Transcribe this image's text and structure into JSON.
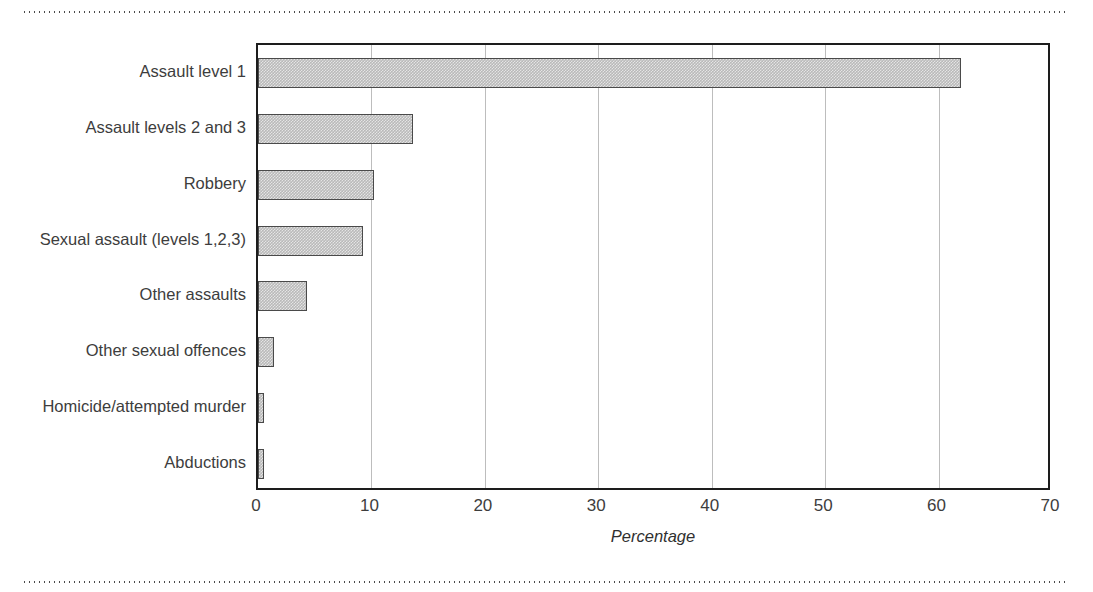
{
  "chart_data": {
    "type": "bar",
    "orientation": "horizontal",
    "title": "",
    "xlabel": "Percentage",
    "ylabel": "",
    "xlim": [
      0,
      70
    ],
    "xticks": [
      0,
      10,
      20,
      30,
      40,
      50,
      60,
      70
    ],
    "grid": "vertical",
    "legend": "none",
    "categories": [
      "Assault level 1",
      "Assault levels 2 and 3",
      "Robbery",
      "Sexual assault (levels 1,2,3)",
      "Other assaults",
      "Other sexual offences",
      "Homicide/attempted murder",
      "Abductions"
    ],
    "values": [
      62.0,
      13.7,
      10.2,
      9.3,
      4.3,
      1.4,
      0.5,
      0.5
    ],
    "bar_fill_color": "#b9b9b9",
    "bar_border_color": "#4a4a4a",
    "frame_color": "#1d1d1d",
    "gridline_color": "#bdbdbd"
  }
}
